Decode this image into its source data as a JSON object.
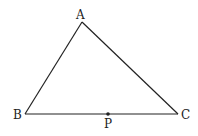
{
  "diagram": {
    "type": "triangle",
    "points": {
      "A": {
        "label": "A",
        "x": 82,
        "y": 22
      },
      "B": {
        "label": "B",
        "x": 25,
        "y": 114
      },
      "C": {
        "label": "C",
        "x": 178,
        "y": 114
      },
      "P": {
        "label": "P",
        "x": 108,
        "y": 114
      }
    },
    "segments": [
      [
        "A",
        "B"
      ],
      [
        "A",
        "C"
      ],
      [
        "B",
        "C"
      ]
    ],
    "stroke_color": "#222222"
  }
}
